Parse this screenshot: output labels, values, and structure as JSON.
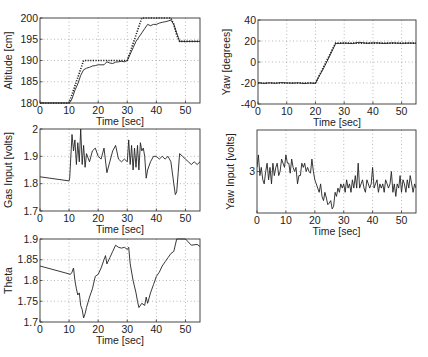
{
  "chart_data": [
    {
      "id": "altitude",
      "type": "line",
      "xlabel": "Time [sec]",
      "ylabel": "Altitude [cm]",
      "xlim": [
        0,
        55
      ],
      "ylim": [
        180,
        200
      ],
      "xticks": [
        0,
        10,
        20,
        30,
        40,
        50
      ],
      "yticks": [
        180,
        185,
        190,
        195,
        200
      ],
      "grid": true,
      "frame": {
        "x": 40,
        "y": 18,
        "w": 160,
        "h": 85
      },
      "series": [
        {
          "name": "reference",
          "style": "dotted",
          "x": [
            0,
            10,
            15,
            30,
            35,
            45,
            46,
            47,
            48,
            55
          ],
          "y": [
            180,
            180,
            190,
            190,
            200,
            200,
            198.5,
            196,
            194.5,
            194.5
          ]
        },
        {
          "name": "measured",
          "style": "solid",
          "x": [
            0,
            10,
            10.5,
            11,
            12,
            13,
            14,
            15,
            16,
            17,
            18,
            19,
            20,
            21,
            22,
            23,
            24,
            25,
            26,
            27,
            28,
            29,
            30,
            31,
            32,
            33,
            34,
            35,
            36,
            37,
            38,
            39,
            40,
            41,
            42,
            43,
            44,
            45,
            46,
            47,
            48,
            55
          ],
          "y": [
            180,
            180,
            180.3,
            181,
            183,
            184.5,
            186.5,
            187.8,
            188.2,
            188.4,
            188.7,
            188.8,
            189,
            189,
            189,
            189.7,
            189.4,
            189.3,
            189.6,
            189.7,
            189.8,
            189.7,
            190,
            191.5,
            193,
            194.5,
            195.5,
            196.5,
            197.5,
            198.5,
            198.2,
            198.5,
            198.5,
            198.8,
            199,
            199.1,
            199.3,
            199.5,
            198.5,
            196.5,
            194.5,
            194.5
          ]
        }
      ]
    },
    {
      "id": "yaw",
      "type": "line",
      "xlabel": "Time [sec]",
      "ylabel": "Yaw [degrees]",
      "xlim": [
        0,
        55
      ],
      "ylim": [
        -40,
        40
      ],
      "xticks": [
        0,
        10,
        20,
        30,
        40,
        50
      ],
      "yticks": [
        -40,
        -20,
        0,
        20,
        40
      ],
      "grid": true,
      "frame": {
        "x": 258,
        "y": 20,
        "w": 158,
        "h": 84
      },
      "series": [
        {
          "name": "reference",
          "style": "dotted",
          "x": [
            0,
            20,
            27,
            55
          ],
          "y": [
            -20,
            -20,
            18,
            18
          ]
        },
        {
          "name": "measured",
          "style": "solid",
          "x": [
            0,
            2,
            4,
            6,
            8,
            10,
            12,
            14,
            16,
            18,
            20,
            21,
            23,
            25,
            27,
            30,
            33,
            35,
            38,
            41,
            44,
            47,
            50,
            53,
            55
          ],
          "y": [
            -19.5,
            -20.5,
            -19.8,
            -20.3,
            -19.6,
            -19.9,
            -20.2,
            -19.8,
            -20.6,
            -20,
            -20.4,
            -15,
            -5,
            6,
            17.5,
            18,
            17.5,
            18.8,
            17.8,
            18.3,
            17.6,
            18.2,
            17.7,
            18.1,
            17.8
          ]
        }
      ]
    },
    {
      "id": "gas_input",
      "type": "line",
      "xlabel": "Time [sec]",
      "ylabel": "Gas Input [volts]",
      "xlim": [
        0,
        55
      ],
      "ylim": [
        1.7,
        2.0
      ],
      "xticks": [
        0,
        10,
        20,
        30,
        40,
        50
      ],
      "yticks": [
        1.7,
        1.8,
        1.9,
        2.0
      ],
      "ytick_labels": [
        "1.7",
        "1.8",
        "1.9",
        "2"
      ],
      "grid": true,
      "frame": {
        "x": 40,
        "y": 129,
        "w": 160,
        "h": 82
      },
      "series": [
        {
          "name": "gas",
          "style": "solid",
          "x": [
            0,
            10,
            10.2,
            11,
            11.5,
            12,
            12.5,
            13,
            13.5,
            14,
            14.5,
            15,
            15.5,
            16,
            17,
            18,
            19,
            20,
            21,
            22,
            23,
            24,
            25,
            26,
            27,
            28,
            29,
            30,
            30.5,
            31,
            31.5,
            32,
            32.5,
            33,
            33.5,
            34,
            34.5,
            35,
            35.5,
            36,
            36.5,
            37,
            38,
            39,
            40,
            41,
            42,
            43,
            44,
            45,
            46,
            46.5,
            47,
            47.5,
            48,
            49,
            50,
            51,
            52,
            53,
            54,
            55
          ],
          "y": [
            1.825,
            1.81,
            1.82,
            1.98,
            1.92,
            1.96,
            1.87,
            1.95,
            1.88,
            2.0,
            1.87,
            1.94,
            1.86,
            1.91,
            1.88,
            1.92,
            1.93,
            1.9,
            1.89,
            1.93,
            1.84,
            1.88,
            1.92,
            1.94,
            1.89,
            1.88,
            1.89,
            1.88,
            1.96,
            1.87,
            1.94,
            1.85,
            1.93,
            1.86,
            1.94,
            1.85,
            1.95,
            1.92,
            1.93,
            1.9,
            1.82,
            1.85,
            1.88,
            1.9,
            1.9,
            1.89,
            1.9,
            1.89,
            1.9,
            1.88,
            1.8,
            1.76,
            1.77,
            1.84,
            1.91,
            1.9,
            1.89,
            1.88,
            1.87,
            1.88,
            1.87,
            1.88
          ]
        }
      ]
    },
    {
      "id": "yaw_input",
      "type": "line",
      "xlabel": "Time [sec]",
      "ylabel": "Yaw Input [volts]",
      "xlim": [
        0,
        55
      ],
      "ylim": [
        2.5,
        3.5
      ],
      "xticks": [
        0,
        10,
        20,
        30,
        40,
        50
      ],
      "yticks": [
        3
      ],
      "grid": true,
      "frame": {
        "x": 257,
        "y": 130,
        "w": 159,
        "h": 83
      },
      "series": [
        {
          "name": "yaw_input",
          "style": "solid",
          "x": [
            0,
            0.5,
            1,
            1.5,
            2,
            2.5,
            3,
            3.5,
            4,
            4.5,
            5,
            5.5,
            6,
            6.5,
            7,
            7.5,
            8,
            8.5,
            9,
            9.5,
            10,
            10.5,
            11,
            11.5,
            12,
            12.5,
            13,
            13.5,
            14,
            14.5,
            15,
            15.5,
            16,
            16.5,
            17,
            17.5,
            18,
            18.5,
            19,
            19.5,
            20,
            20.5,
            21,
            21.5,
            22,
            22.5,
            23,
            23.5,
            24,
            24.5,
            25,
            25.5,
            26,
            26.5,
            27,
            27.5,
            28,
            28.5,
            29,
            29.5,
            30,
            30.5,
            31,
            31.5,
            32,
            32.5,
            33,
            33.5,
            34,
            34.5,
            35,
            35.5,
            36,
            36.5,
            37,
            37.5,
            38,
            38.5,
            39,
            39.5,
            40,
            40.5,
            41,
            41.5,
            42,
            42.5,
            43,
            43.5,
            44,
            44.5,
            45,
            45.5,
            46,
            46.5,
            47,
            47.5,
            48,
            48.5,
            49,
            49.5,
            50,
            50.5,
            51,
            51.5,
            52,
            52.5,
            53,
            53.5,
            54,
            54.5,
            55
          ],
          "y": [
            3.05,
            3.2,
            2.95,
            3.05,
            2.9,
            2.85,
            3.0,
            3.1,
            2.9,
            3.05,
            2.85,
            3.1,
            2.95,
            3.05,
            3.1,
            2.95,
            3.0,
            3.15,
            3.1,
            3.05,
            3.2,
            3.1,
            3.1,
            2.98,
            3.15,
            3.05,
            3.0,
            3.05,
            2.85,
            2.95,
            2.95,
            3.1,
            3.05,
            3.1,
            3.0,
            3.05,
            3.0,
            2.98,
            3.15,
            3.0,
            2.9,
            2.85,
            2.8,
            2.75,
            2.85,
            2.7,
            2.65,
            2.75,
            2.68,
            2.6,
            2.62,
            2.65,
            2.55,
            2.58,
            2.75,
            2.7,
            2.8,
            2.75,
            2.85,
            2.8,
            2.85,
            2.75,
            2.9,
            2.8,
            2.85,
            2.75,
            2.9,
            2.8,
            2.95,
            2.8,
            3.1,
            2.8,
            2.85,
            2.9,
            2.8,
            2.75,
            2.9,
            2.85,
            2.8,
            2.85,
            3.05,
            2.8,
            2.85,
            2.9,
            2.75,
            2.85,
            2.8,
            2.85,
            2.75,
            2.9,
            2.85,
            2.8,
            2.85,
            3.0,
            2.75,
            2.85,
            2.7,
            2.85,
            2.8,
            2.95,
            2.75,
            2.9,
            2.85,
            2.75,
            2.9,
            2.8,
            2.95,
            2.85,
            2.75,
            2.85,
            2.8,
            2.9,
            2.85
          ]
        }
      ]
    },
    {
      "id": "theta",
      "type": "line",
      "xlabel": "Time [sec]",
      "ylabel": "Theta",
      "xlim": [
        0,
        55
      ],
      "ylim": [
        1.7,
        1.9
      ],
      "xticks": [
        0,
        10,
        20,
        30,
        40,
        50
      ],
      "yticks": [
        1.7,
        1.75,
        1.8,
        1.85,
        1.9
      ],
      "ytick_labels": [
        "1.7",
        "1.75",
        "1.8",
        "1.85",
        "1.9"
      ],
      "grid": true,
      "frame": {
        "x": 40,
        "y": 239,
        "w": 160,
        "h": 83
      },
      "series": [
        {
          "name": "theta",
          "style": "solid",
          "x": [
            0,
            10.5,
            11,
            11.5,
            12,
            12.5,
            13,
            13.5,
            14,
            14.5,
            15,
            15.5,
            16,
            17,
            18,
            19,
            20,
            21,
            22,
            22.5,
            23,
            24,
            25,
            26,
            27,
            28,
            29,
            30,
            30.5,
            31,
            32,
            33,
            33.5,
            34,
            35,
            36,
            36.5,
            37,
            38,
            39,
            40,
            41,
            42,
            43,
            44,
            45,
            46,
            47,
            48,
            50,
            52,
            54,
            55
          ],
          "y": [
            1.835,
            1.815,
            1.82,
            1.83,
            1.8,
            1.78,
            1.765,
            1.77,
            1.74,
            1.73,
            1.71,
            1.72,
            1.735,
            1.76,
            1.78,
            1.81,
            1.815,
            1.83,
            1.85,
            1.86,
            1.84,
            1.855,
            1.87,
            1.885,
            1.88,
            1.878,
            1.88,
            1.875,
            1.88,
            1.84,
            1.8,
            1.77,
            1.75,
            1.735,
            1.745,
            1.74,
            1.76,
            1.745,
            1.77,
            1.79,
            1.81,
            1.82,
            1.835,
            1.845,
            1.855,
            1.865,
            1.87,
            1.9,
            1.9,
            1.9,
            1.885,
            1.887,
            1.882
          ]
        }
      ]
    }
  ]
}
